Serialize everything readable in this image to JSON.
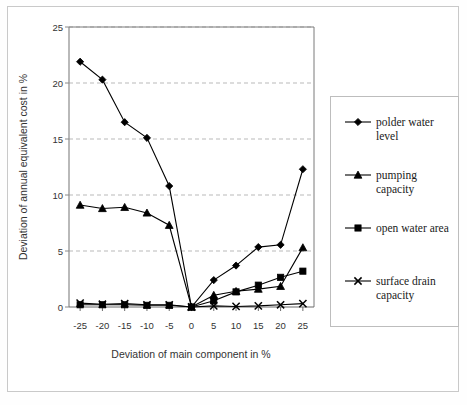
{
  "chart_data": {
    "type": "line",
    "title": "",
    "xlabel": "Deviation of main component in %",
    "ylabel": "Deviation of annual equivalent cost in %",
    "x": [
      -25,
      -20,
      -15,
      -10,
      -5,
      0,
      5,
      10,
      15,
      20,
      25
    ],
    "xtick_labels": [
      "-25",
      "-20",
      "-15",
      "-10",
      "-5",
      "0",
      "5",
      "10",
      "15",
      "20",
      "25"
    ],
    "ytick_labels": [
      "0",
      "5",
      "10",
      "15",
      "20",
      "25"
    ],
    "xlim": [
      -27.5,
      27.5
    ],
    "ylim": [
      0,
      25
    ],
    "grid": "horizontal-dashed",
    "legend_position": "right-outside",
    "series": [
      {
        "name": "polder water level",
        "marker": "diamond",
        "color": "#000000",
        "values": [
          21.9,
          20.3,
          16.5,
          15.1,
          10.8,
          0.0,
          2.4,
          3.7,
          5.35,
          5.55,
          12.3
        ]
      },
      {
        "name": "pumping capacity",
        "marker": "triangle",
        "color": "#000000",
        "values": [
          9.1,
          8.8,
          8.9,
          8.4,
          7.3,
          0.0,
          1.05,
          1.4,
          1.6,
          1.85,
          5.3
        ]
      },
      {
        "name": "open water area",
        "marker": "square",
        "color": "#000000",
        "values": [
          0.2,
          0.2,
          0.2,
          0.15,
          0.15,
          0.0,
          0.55,
          1.35,
          1.95,
          2.65,
          3.2
        ]
      },
      {
        "name": "surface drain capacity",
        "marker": "cross",
        "color": "#000000",
        "values": [
          0.35,
          0.25,
          0.3,
          0.2,
          0.2,
          0.0,
          0.1,
          0.05,
          0.1,
          0.2,
          0.3
        ]
      }
    ]
  },
  "legend": {
    "items": [
      {
        "label_line1": "polder water",
        "label_line2": "level",
        "marker": "diamond"
      },
      {
        "label_line1": "pumping",
        "label_line2": "capacity",
        "marker": "triangle"
      },
      {
        "label_line1": "open water area",
        "label_line2": "",
        "marker": "square"
      },
      {
        "label_line1": "surface drain",
        "label_line2": "capacity",
        "marker": "cross"
      }
    ]
  }
}
